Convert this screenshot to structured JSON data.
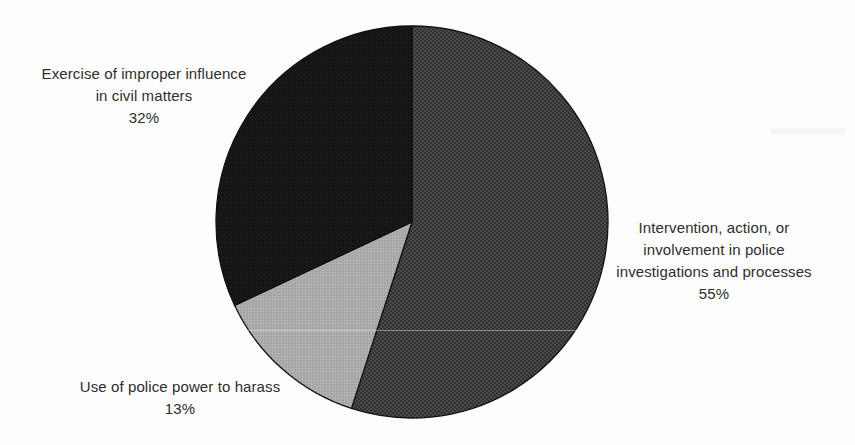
{
  "page": {
    "background_color": "#fdfdfd",
    "label_text_color": "#2e2e2e"
  },
  "chart_data": {
    "type": "pie",
    "title": "",
    "start_angle_deg": 0,
    "direction": "clockwise",
    "outline_color": "#101010",
    "legend_position": "none",
    "labels_placement": "outside",
    "slices": [
      {
        "name": "police-investigations",
        "label": "Intervention, action, or involvement in police investigations and processes",
        "label_lines": [
          "Intervention, action, or",
          "involvement in police",
          "investigations and processes"
        ],
        "pct": 55,
        "pct_label": "55%",
        "color": "#3e3e3e",
        "texture": "weave-dark"
      },
      {
        "name": "police-power-harass",
        "label": "Use of police power to harass",
        "label_lines": [
          "Use of police power to harass"
        ],
        "pct": 13,
        "pct_label": "13%",
        "color": "#aeaeae",
        "texture": "halftone-light"
      },
      {
        "name": "improper-influence-civil",
        "label": "Exercise of improper influence in civil matters",
        "label_lines": [
          "Exercise of improper influence",
          "in civil matters"
        ],
        "pct": 32,
        "pct_label": "32%",
        "color": "#161616",
        "texture": "noise-black"
      }
    ]
  }
}
